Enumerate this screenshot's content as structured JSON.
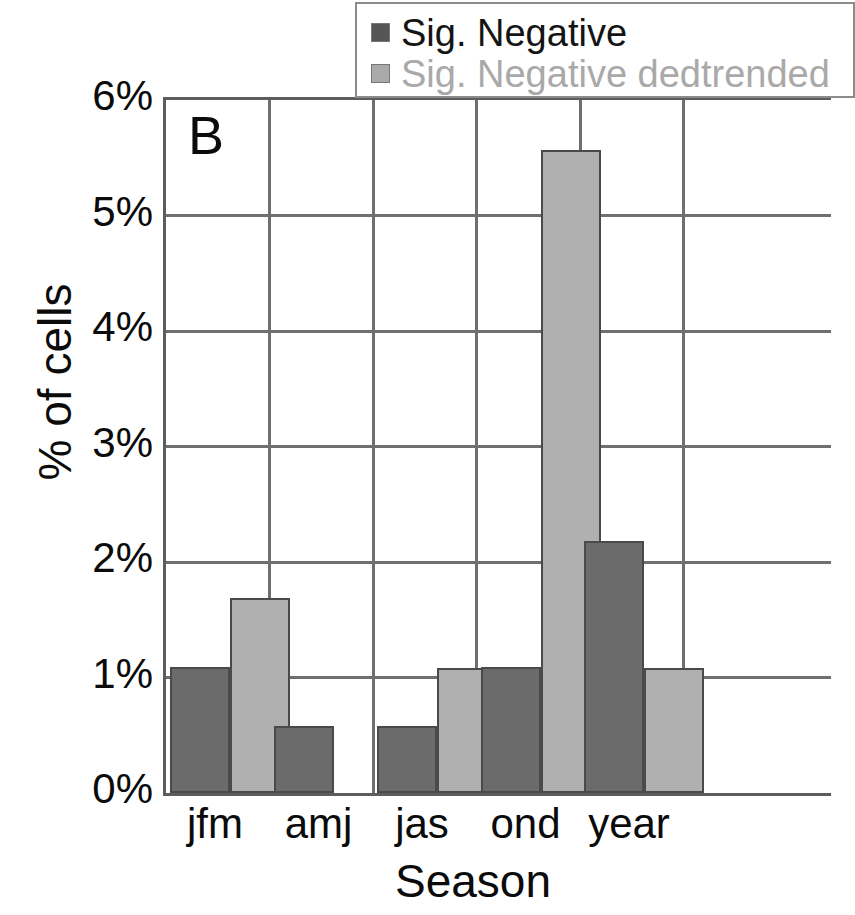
{
  "chart_data": {
    "type": "bar",
    "title": "",
    "panel_label": "B",
    "xlabel": "Season",
    "ylabel": "% of cells",
    "categories": [
      "jfm",
      "amj",
      "jas",
      "ond",
      "year"
    ],
    "series": [
      {
        "name": "Sig. Negative",
        "color": "#6b6b6b",
        "values": [
          1.09,
          0.58,
          0.58,
          1.09,
          2.18
        ]
      },
      {
        "name": "Sig. Negative dedtrended",
        "color": "#b0b0b0",
        "values": [
          1.69,
          0,
          1.08,
          5.57,
          1.08
        ]
      }
    ],
    "ylim": [
      0,
      6
    ],
    "ytick_labels": [
      "6%",
      "5%",
      "4%",
      "3%",
      "2%",
      "1%",
      "0%"
    ],
    "ytick_values": [
      6,
      5,
      4,
      3,
      2,
      1,
      0
    ],
    "grid": "horizontal-and-category-dividers",
    "legend_position": "top-center"
  },
  "legend": {
    "entries": [
      {
        "label": "Sig. Negative",
        "swatch": "dark-gray-square"
      },
      {
        "label": "Sig. Negative dedtrended",
        "swatch": "light-gray-square"
      }
    ]
  }
}
